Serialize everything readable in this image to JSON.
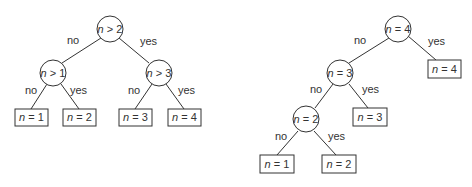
{
  "trees": [
    {
      "name": "balanced-tree",
      "nodes": [
        {
          "id": "root",
          "var": "n",
          "op": " > ",
          "val": "2",
          "type": "decision"
        },
        {
          "id": "a",
          "var": "n",
          "op": " > ",
          "val": "1",
          "type": "decision"
        },
        {
          "id": "b",
          "var": "n",
          "op": " > ",
          "val": "3",
          "type": "decision"
        },
        {
          "id": "l1",
          "var": "n",
          "op": " = ",
          "val": "1",
          "type": "leaf"
        },
        {
          "id": "l2",
          "var": "n",
          "op": " = ",
          "val": "2",
          "type": "leaf"
        },
        {
          "id": "l3",
          "var": "n",
          "op": " = ",
          "val": "3",
          "type": "leaf"
        },
        {
          "id": "l4",
          "var": "n",
          "op": " = ",
          "val": "4",
          "type": "leaf"
        }
      ],
      "edges": [
        {
          "from": "root",
          "to": "a",
          "label": "no"
        },
        {
          "from": "root",
          "to": "b",
          "label": "yes"
        },
        {
          "from": "a",
          "to": "l1",
          "label": "no"
        },
        {
          "from": "a",
          "to": "l2",
          "label": "yes"
        },
        {
          "from": "b",
          "to": "l3",
          "label": "no"
        },
        {
          "from": "b",
          "to": "l4",
          "label": "yes"
        }
      ]
    },
    {
      "name": "linear-tree",
      "nodes": [
        {
          "id": "root",
          "var": "n",
          "op": " = ",
          "val": "4",
          "type": "decision"
        },
        {
          "id": "l4",
          "var": "n",
          "op": " = ",
          "val": "4",
          "type": "leaf"
        },
        {
          "id": "c",
          "var": "n",
          "op": " = ",
          "val": "3",
          "type": "decision"
        },
        {
          "id": "l3",
          "var": "n",
          "op": " = ",
          "val": "3",
          "type": "leaf"
        },
        {
          "id": "d",
          "var": "n",
          "op": " = ",
          "val": "2",
          "type": "decision"
        },
        {
          "id": "l1",
          "var": "n",
          "op": " = ",
          "val": "1",
          "type": "leaf"
        },
        {
          "id": "l2",
          "var": "n",
          "op": " = ",
          "val": "2",
          "type": "leaf"
        }
      ],
      "edges": [
        {
          "from": "root",
          "to": "c",
          "label": "no"
        },
        {
          "from": "root",
          "to": "l4",
          "label": "yes"
        },
        {
          "from": "c",
          "to": "d",
          "label": "no"
        },
        {
          "from": "c",
          "to": "l3",
          "label": "yes"
        },
        {
          "from": "d",
          "to": "l1",
          "label": "no"
        },
        {
          "from": "d",
          "to": "l2",
          "label": "yes"
        }
      ]
    }
  ]
}
